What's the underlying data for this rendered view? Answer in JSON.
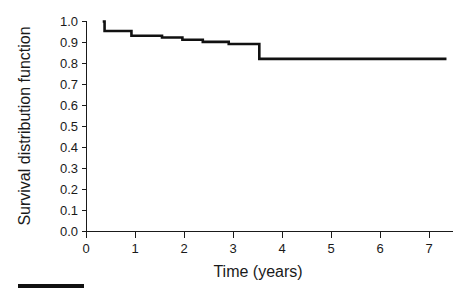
{
  "chart_data": {
    "type": "line",
    "title": "",
    "subtitle": "",
    "xlabel": "Time (years)",
    "ylabel": "Survival distribution function",
    "xlim": [
      -0.35,
      7.55
    ],
    "ylim": [
      0.0,
      1.0
    ],
    "grid": false,
    "legend": null,
    "annotations": [],
    "style": "kaplan-meier step curve",
    "xticks": [
      0,
      1,
      2,
      3,
      4,
      5,
      6,
      7
    ],
    "xtick_labels": [
      "0",
      "1",
      "2",
      "3",
      "4",
      "5",
      "6",
      "7"
    ],
    "yticks": [
      0.0,
      0.1,
      0.2,
      0.3,
      0.4,
      0.5,
      0.6,
      0.7,
      0.8,
      0.9,
      1.0
    ],
    "ytick_labels": [
      "0.0",
      "0.1",
      "0.2",
      "0.3",
      "0.4",
      "0.5",
      "0.6",
      "0.7",
      "0.8",
      "0.9",
      "1.0"
    ],
    "series": [
      {
        "name": "Survival distribution function",
        "color": "#111111",
        "step": "post",
        "x": [
          0.0,
          0.04,
          0.55,
          0.62,
          1.05,
          1.28,
          1.52,
          1.72,
          2.02,
          2.16,
          2.45,
          2.72,
          3.28,
          3.38,
          7.42
        ],
        "y": [
          1.0,
          0.955,
          0.955,
          0.932,
          0.932,
          0.924,
          0.924,
          0.913,
          0.913,
          0.903,
          0.903,
          0.893,
          0.893,
          0.822,
          0.822
        ]
      }
    ],
    "points": [
      {
        "time": 0.0,
        "survival": 1.0
      },
      {
        "time": 0.04,
        "survival": 0.955
      },
      {
        "time": 0.55,
        "survival": 0.955
      },
      {
        "time": 0.62,
        "survival": 0.932
      },
      {
        "time": 1.05,
        "survival": 0.932
      },
      {
        "time": 1.28,
        "survival": 0.924
      },
      {
        "time": 1.52,
        "survival": 0.924
      },
      {
        "time": 1.72,
        "survival": 0.913
      },
      {
        "time": 2.02,
        "survival": 0.913
      },
      {
        "time": 2.16,
        "survival": 0.903
      },
      {
        "time": 2.45,
        "survival": 0.903
      },
      {
        "time": 2.72,
        "survival": 0.893
      },
      {
        "time": 3.28,
        "survival": 0.893
      },
      {
        "time": 3.38,
        "survival": 0.822
      },
      {
        "time": 7.42,
        "survival": 0.822
      }
    ]
  },
  "figure": {
    "background_color": "#ffffff",
    "curve_color": "#111111",
    "axis_color": "#1a1a1a",
    "scale_bar_label": ""
  }
}
